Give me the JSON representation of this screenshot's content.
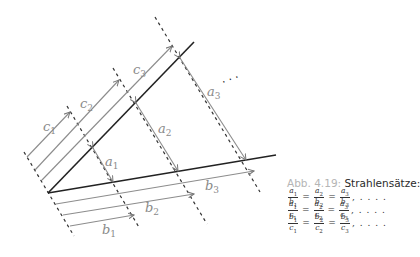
{
  "figure": {
    "labels": {
      "c1": {
        "base": "c",
        "sub": "1"
      },
      "c2": {
        "base": "c",
        "sub": "2"
      },
      "c3": {
        "base": "c",
        "sub": "3"
      },
      "a1": {
        "base": "a",
        "sub": "1"
      },
      "a2": {
        "base": "a",
        "sub": "2"
      },
      "a3": {
        "base": "a",
        "sub": "3"
      },
      "b1": {
        "base": "b",
        "sub": "1"
      },
      "b2": {
        "base": "b",
        "sub": "2"
      },
      "b3": {
        "base": "b",
        "sub": "3"
      },
      "ellipsis": "· · ·"
    },
    "colors": {
      "main_line": "#222222",
      "dim_line": "#8c8c8c",
      "label": "#8a8a8a",
      "dash": "#333333"
    }
  },
  "caption": {
    "number": "Abb. 4.19:",
    "title": "Strahlensätze:",
    "rows": [
      {
        "fracs": [
          {
            "num": "a1",
            "den": "b1"
          },
          {
            "num": "a2",
            "den": "b2"
          },
          {
            "num": "a3",
            "den": "b3"
          }
        ],
        "eq": "=",
        "tail": ", . . . ."
      },
      {
        "fracs": [
          {
            "num": "a1",
            "den": "c1"
          },
          {
            "num": "a2",
            "den": "c2"
          },
          {
            "num": "a3",
            "den": "c3"
          }
        ],
        "eq": "=",
        "tail": ", . . . ."
      },
      {
        "fracs": [
          {
            "num": "b1",
            "den": "c1"
          },
          {
            "num": "b2",
            "den": "c2"
          },
          {
            "num": "b3",
            "den": "c3"
          }
        ],
        "eq": "=",
        "tail": ", . . . ."
      }
    ]
  }
}
